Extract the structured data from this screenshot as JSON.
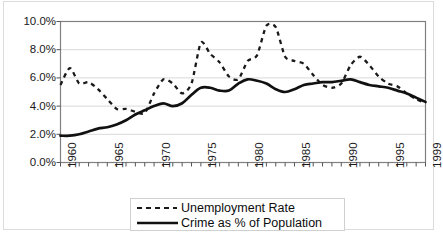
{
  "chart_data": {
    "type": "line",
    "title": "",
    "subtitle": "",
    "xlabel": "",
    "ylabel": "",
    "grid": true,
    "legend_position": "bottom-center",
    "xlim": [
      1960,
      1999
    ],
    "ylim": [
      0.0,
      10.0
    ],
    "y_tick_labels": [
      "10.0%",
      "8.0%",
      "6.0%",
      "4.0%",
      "2.0%",
      "0.0%"
    ],
    "y_ticks": [
      10.0,
      8.0,
      6.0,
      4.0,
      2.0,
      0.0
    ],
    "x_tick_labels": [
      "1960",
      "1965",
      "1970",
      "1975",
      "1980",
      "1985",
      "1990",
      "1995",
      "1999"
    ],
    "x_ticks": [
      1960,
      1965,
      1970,
      1975,
      1980,
      1985,
      1990,
      1995,
      1999
    ],
    "x_minor_ticks_every": 1,
    "x": [
      1960,
      1961,
      1962,
      1963,
      1964,
      1965,
      1966,
      1967,
      1968,
      1969,
      1970,
      1971,
      1972,
      1973,
      1974,
      1975,
      1976,
      1977,
      1978,
      1979,
      1980,
      1981,
      1982,
      1983,
      1984,
      1985,
      1986,
      1987,
      1988,
      1989,
      1990,
      1991,
      1992,
      1993,
      1994,
      1995,
      1996,
      1997,
      1998,
      1999
    ],
    "series": [
      {
        "name": "Unemployment Rate",
        "style": "dashed",
        "color": "#1a1a1a",
        "values": [
          5.5,
          6.7,
          5.6,
          5.7,
          5.2,
          4.5,
          3.8,
          3.8,
          3.6,
          3.5,
          4.9,
          5.9,
          5.6,
          4.9,
          5.6,
          8.5,
          7.7,
          7.1,
          6.1,
          5.9,
          7.2,
          7.6,
          9.7,
          9.6,
          7.5,
          7.2,
          7.0,
          6.2,
          5.5,
          5.3,
          5.6,
          6.9,
          7.5,
          6.9,
          6.1,
          5.6,
          5.4,
          4.9,
          4.5,
          4.2
        ]
      },
      {
        "name": "Crime as % of Population",
        "style": "solid",
        "color": "#111111",
        "values": [
          1.9,
          1.9,
          2.0,
          2.2,
          2.4,
          2.5,
          2.7,
          3.0,
          3.4,
          3.7,
          4.0,
          4.2,
          4.0,
          4.2,
          4.8,
          5.3,
          5.3,
          5.1,
          5.1,
          5.6,
          5.9,
          5.8,
          5.6,
          5.2,
          5.0,
          5.2,
          5.5,
          5.6,
          5.7,
          5.7,
          5.8,
          5.9,
          5.7,
          5.5,
          5.4,
          5.3,
          5.1,
          4.9,
          4.6,
          4.3
        ]
      }
    ]
  },
  "axes": {
    "y_labels": [
      "10.0%",
      "8.0%",
      "6.0%",
      "4.0%",
      "2.0%",
      "0.0%"
    ],
    "x_labels": [
      "1960",
      "1965",
      "1970",
      "1975",
      "1980",
      "1985",
      "1990",
      "1995",
      "1999"
    ]
  },
  "legend": {
    "items": [
      {
        "label": "Unemployment Rate",
        "style": "dashed"
      },
      {
        "label": "Crime as % of Population",
        "style": "solid"
      }
    ]
  },
  "colors": {
    "plot_border": "#808080",
    "gridline": "#d9d9d9",
    "series_line": "#111111",
    "outer_frame": "#dcdcdc",
    "text": "#1a1a1a",
    "background": "#ffffff"
  }
}
